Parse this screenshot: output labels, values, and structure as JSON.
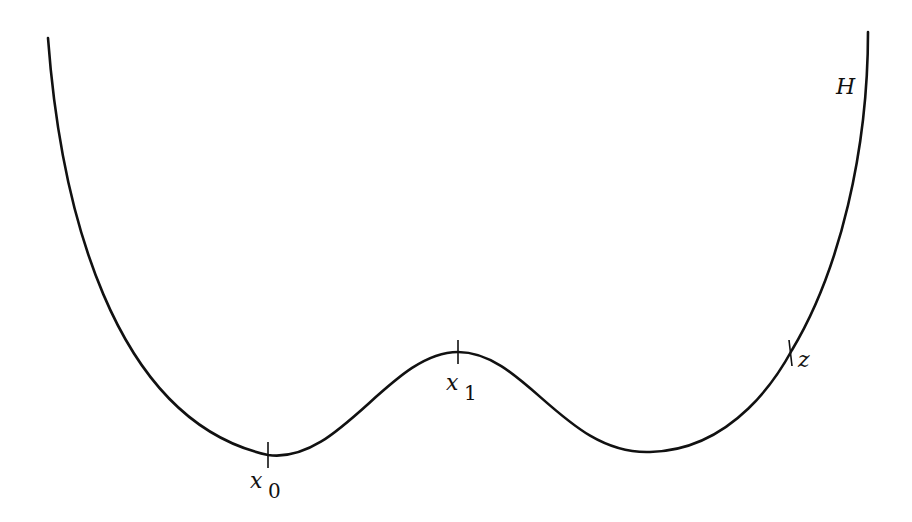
{
  "diagram": {
    "type": "potential-well-curve",
    "stroke_color": "#111111",
    "background": "#ffffff",
    "curve_label": "H",
    "points": [
      {
        "id": "x0",
        "label": "x",
        "subscript": "0",
        "role": "left minimum"
      },
      {
        "id": "x1",
        "label": "x",
        "subscript": "1",
        "role": "local maximum"
      },
      {
        "id": "z",
        "label": "z",
        "subscript": "",
        "role": "point on right branch"
      }
    ]
  }
}
